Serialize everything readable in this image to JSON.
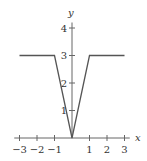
{
  "chart_data": {
    "type": "line",
    "title": "",
    "xlabel": "x",
    "ylabel": "y",
    "xlim": [
      -3,
      3
    ],
    "ylim": [
      0,
      4
    ],
    "grid": false,
    "legend": null,
    "x_ticks": [
      -3,
      -2,
      -1,
      1,
      2,
      3
    ],
    "x_tick_labels": [
      "−3",
      "−2",
      "−1",
      "1",
      "2",
      "3"
    ],
    "y_ticks": [
      1,
      2,
      3,
      4
    ],
    "y_tick_labels": [
      "1",
      "2",
      "3",
      "4"
    ],
    "series": [
      {
        "name": "f(x)",
        "x": [
          -3,
          -1,
          0,
          1,
          3
        ],
        "y": [
          3,
          3,
          0,
          3,
          3
        ]
      }
    ],
    "colors": {
      "line": "#555555",
      "axis": "#666666",
      "text": "#333333"
    }
  }
}
